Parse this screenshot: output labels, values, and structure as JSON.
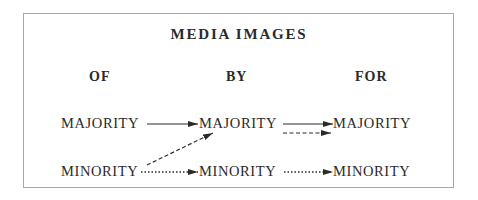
{
  "diagram": {
    "title": "MEDIA IMAGES",
    "columns": [
      {
        "label": "OF"
      },
      {
        "label": "BY"
      },
      {
        "label": "FOR"
      }
    ],
    "nodes": {
      "of_majority": "MAJORITY",
      "of_minority": "MINORITY",
      "by_majority": "MAJORITY",
      "by_minority": "MINORITY",
      "for_majority": "MAJORITY",
      "for_minority": "MINORITY"
    },
    "edges": [
      {
        "from": "of_majority",
        "to": "by_majority",
        "style": "solid"
      },
      {
        "from": "of_minority",
        "to": "by_majority",
        "style": "dashed"
      },
      {
        "from": "of_minority",
        "to": "by_minority",
        "style": "dotted"
      },
      {
        "from": "by_majority",
        "to": "for_majority",
        "style": "solid"
      },
      {
        "from": "by_majority",
        "to": "for_majority",
        "style": "dashed"
      },
      {
        "from": "by_minority",
        "to": "for_minority",
        "style": "dotted"
      }
    ],
    "colors": {
      "ink": "#2a2a2a",
      "border": "#a8a8a8",
      "background": "#ffffff"
    }
  }
}
